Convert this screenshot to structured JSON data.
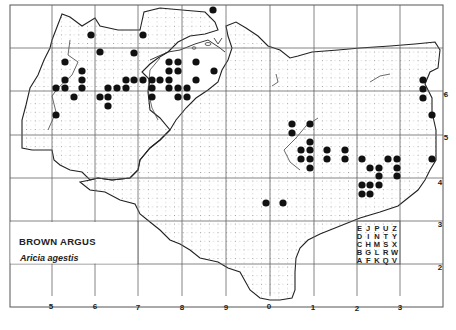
{
  "map": {
    "title": "BROWN ARGUS",
    "subtitle": "Aricia agestis",
    "x_axis_labels": [
      "5",
      "6",
      "7",
      "8",
      "9",
      "0",
      "1",
      "2",
      "3"
    ],
    "y_axis_labels": [
      "6",
      "5",
      "4",
      "3",
      "2"
    ],
    "tetrad_key": {
      "rows": [
        [
          "E",
          "J",
          "P",
          "U",
          "Z"
        ],
        [
          "D",
          "I",
          "N",
          "T",
          "Y"
        ],
        [
          "C",
          "H",
          "M",
          "S",
          "X"
        ],
        [
          "B",
          "G",
          "L",
          "R",
          "W"
        ],
        [
          "A",
          "F",
          "K",
          "Q",
          "V"
        ]
      ]
    },
    "record_symbol": "filled-circle",
    "record_count": 94,
    "colors": {
      "ink": "#222222",
      "grid": "#555555",
      "dot_grid": "#999999",
      "background": "#ffffff"
    }
  }
}
